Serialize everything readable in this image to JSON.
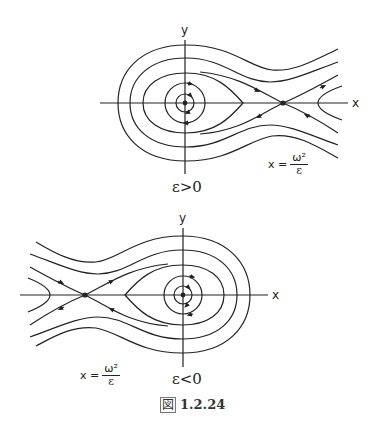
{
  "figure": {
    "caption_prefix": "図",
    "caption_number": "1.2.24",
    "panels": [
      {
        "id": "top",
        "condition": "ε>0",
        "x_axis_label": "x",
        "y_axis_label": "y",
        "saddle_label_lhs": "x =",
        "saddle_label_num": "ω²",
        "saddle_label_den": "ε",
        "center": "origin (elliptic point)",
        "saddle_position": "right of origin at x = ω²/ε"
      },
      {
        "id": "bottom",
        "condition": "ε<0",
        "x_axis_label": "x",
        "y_axis_label": "y",
        "saddle_label_lhs": "x =",
        "saddle_label_num": "ω²",
        "saddle_label_den": "ε",
        "center": "origin (elliptic point)",
        "saddle_position": "left of origin at x = ω²/ε"
      }
    ]
  },
  "colors": {
    "line": "#222222",
    "background": "#ffffff"
  }
}
